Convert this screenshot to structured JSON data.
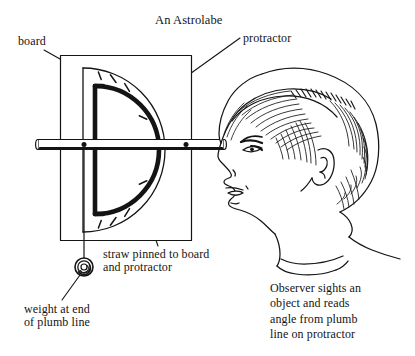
{
  "figure": {
    "title": "An Astrolabe",
    "domain_kind": "instructional-line-diagram",
    "background_color": "#ffffff",
    "ink_color": "#141414"
  },
  "labels": {
    "title": "An Astrolabe",
    "board": "board",
    "protractor": "protractor",
    "straw": "straw pinned to board\nand protractor",
    "weight": "weight at end\nof plumb line",
    "observer_caption": "Observer sights an\nobject and reads\nangle from plumb\nline on protractor"
  },
  "diagram_parts": [
    {
      "name": "board",
      "description": "square wooden board outline"
    },
    {
      "name": "protractor",
      "description": "semicircular protractor with degree tick marks"
    },
    {
      "name": "straw",
      "description": "horizontal sighting straw pinned across the board"
    },
    {
      "name": "pin-upper",
      "description": "pin at protractor center / plumb anchor"
    },
    {
      "name": "pin-outer",
      "description": "second pin holding straw to board"
    },
    {
      "name": "plumb-line",
      "description": "vertical string hanging from center pin"
    },
    {
      "name": "weight",
      "description": "washer weight at end of plumb line"
    },
    {
      "name": "observer-head",
      "description": "profile drawing of observer facing left"
    }
  ],
  "protractor": {
    "tick_count": 10,
    "arc_span_degrees": 180,
    "flat_edge_orientation": "vertical",
    "arc_opens_toward": "right"
  }
}
